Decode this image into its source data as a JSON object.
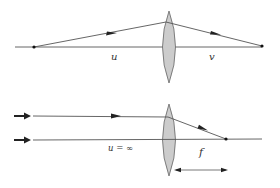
{
  "diagram": {
    "colors": {
      "line": "#555555",
      "lens_fill": "#cccccc",
      "lens_stroke": "#666666",
      "arrow": "#222222",
      "point": "#111111",
      "text": "#333333"
    },
    "top": {
      "object_distance_label": "u",
      "image_distance_label": "v",
      "elements": [
        "optical-axis",
        "convex-lens",
        "object-point",
        "image-point",
        "incident-ray",
        "refracted-ray"
      ]
    },
    "bottom": {
      "object_distance_label": "u = ∞",
      "focal_length_label": "f",
      "elements": [
        "optical-axis",
        "convex-lens",
        "parallel-ray-upper",
        "parallel-ray-axis",
        "focal-point",
        "focal-length-dimension"
      ]
    }
  }
}
